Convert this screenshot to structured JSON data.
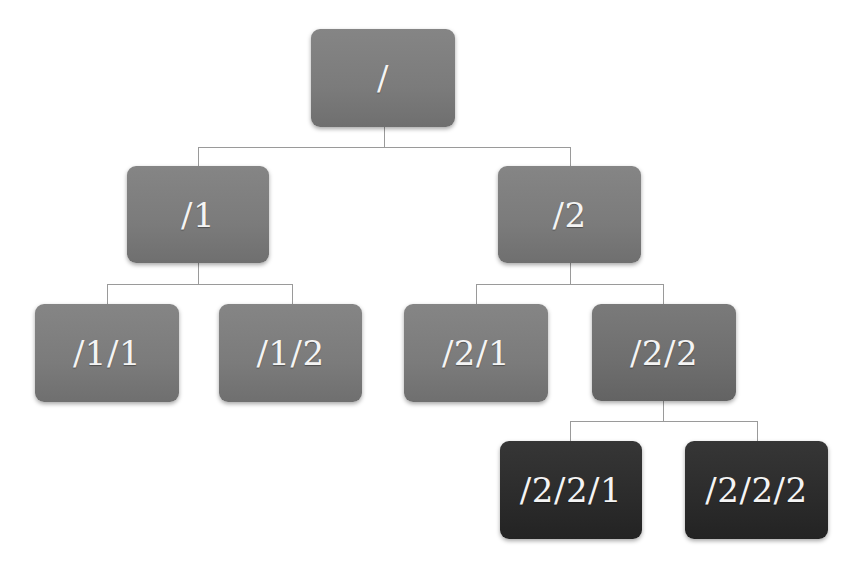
{
  "diagram": {
    "type": "tree",
    "root": {
      "label": "/",
      "children": [
        {
          "label": "/1",
          "children": [
            {
              "label": "/1/1",
              "children": []
            },
            {
              "label": "/1/2",
              "children": []
            }
          ]
        },
        {
          "label": "/2",
          "children": [
            {
              "label": "/2/1",
              "children": []
            },
            {
              "label": "/2/2",
              "children": [
                {
                  "label": "/2/2/1",
                  "children": []
                },
                {
                  "label": "/2/2/2",
                  "children": []
                }
              ]
            }
          ]
        }
      ]
    },
    "nodes": {
      "root": "/",
      "n1": "/1",
      "n2": "/2",
      "n11": "/1/1",
      "n12": "/1/2",
      "n21": "/2/1",
      "n22": "/2/2",
      "n221": "/2/2/1",
      "n222": "/2/2/2"
    },
    "colors": {
      "node_fill": "#7b7b7b",
      "node_fill_highlight": "#6e6e6e",
      "leaf_dark_fill": "#2b2b2b",
      "text": "#f4f4f4",
      "connector": "#9a9a9a",
      "background": "#ffffff"
    }
  }
}
